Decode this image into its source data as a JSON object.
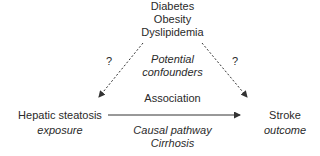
{
  "confounders": {
    "items": [
      "Diabetes",
      "Obesity",
      "Dyslipidemia"
    ],
    "label_line1": "Potential",
    "label_line2": "confounders"
  },
  "exposure": {
    "name": "Hepatic steatosis",
    "role": "exposure"
  },
  "outcome": {
    "name": "Stroke",
    "role": "outcome"
  },
  "association_label": "Association",
  "causal_pathway": {
    "label": "Causal pathway",
    "mediator": "Cirrhosis"
  },
  "uncertain_marks": {
    "left": "?",
    "right": "?"
  },
  "colors": {
    "text": "#2a2a2a",
    "arrow": "#333333"
  }
}
